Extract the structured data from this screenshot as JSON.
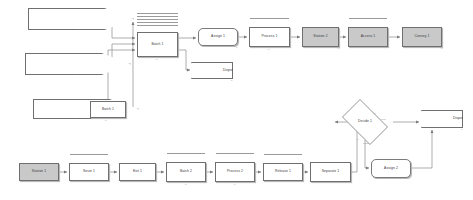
{
  "diagram": {
    "background_color": "#ffffff",
    "line_color": "#8a8a8a",
    "fill_default": "#ffffff",
    "fill_highlight": "#c9c9c9",
    "border_color": "#6f6f6f"
  },
  "nodes": [
    {
      "id": "create1",
      "label": "Create 1",
      "shape": "create",
      "x": 28,
      "y": 8,
      "w": 52,
      "h": 22,
      "fill": "#ffffff"
    },
    {
      "id": "create2",
      "label": "Create 2",
      "shape": "create",
      "x": 25,
      "y": 53,
      "w": 52,
      "h": 22,
      "fill": "#ffffff"
    },
    {
      "id": "create3",
      "label": "Create 3",
      "shape": "create",
      "x": 33,
      "y": 99,
      "w": 45,
      "h": 20,
      "fill": "#ffffff"
    },
    {
      "id": "batch1b",
      "label": "Batch 1",
      "shape": "rect",
      "x": 90,
      "y": 101,
      "w": 36,
      "h": 17,
      "fill": "#ffffff"
    },
    {
      "id": "batch1",
      "label": "Batch 1",
      "shape": "rect",
      "x": 137,
      "y": 32,
      "w": 41,
      "h": 25,
      "fill": "#ffffff"
    },
    {
      "id": "assign1",
      "label": "Assign 1",
      "shape": "assign",
      "x": 198,
      "y": 28,
      "w": 40,
      "h": 18,
      "fill": "#ffffff"
    },
    {
      "id": "dispose1",
      "label": "Dispose 1",
      "shape": "dispose",
      "x": 191,
      "y": 62,
      "w": 42,
      "h": 17,
      "fill": "#ffffff"
    },
    {
      "id": "process1",
      "label": "Process 1",
      "shape": "rect",
      "x": 249,
      "y": 27,
      "w": 41,
      "h": 20,
      "fill": "#ffffff"
    },
    {
      "id": "station2",
      "label": "Station 2",
      "shape": "rect",
      "x": 302,
      "y": 27,
      "w": 37,
      "h": 20,
      "fill": "#c9c9c9"
    },
    {
      "id": "access1",
      "label": "Access 1",
      "shape": "rect",
      "x": 348,
      "y": 27,
      "w": 40,
      "h": 20,
      "fill": "#c9c9c9"
    },
    {
      "id": "convey1",
      "label": "Convey 1",
      "shape": "rect",
      "x": 402,
      "y": 27,
      "w": 40,
      "h": 20,
      "fill": "#c9c9c9"
    },
    {
      "id": "decide1",
      "label": "Decide 1",
      "shape": "decide",
      "x": 337,
      "y": 104,
      "w": 56,
      "h": 36,
      "fill": "#ffffff"
    },
    {
      "id": "dispose2",
      "label": "Dispose 2",
      "shape": "dispose",
      "x": 421,
      "y": 110,
      "w": 42,
      "h": 18,
      "fill": "#ffffff"
    },
    {
      "id": "assign2",
      "label": "Assign 2",
      "shape": "assign",
      "x": 371,
      "y": 159,
      "w": 40,
      "h": 19,
      "fill": "#ffffff"
    },
    {
      "id": "station1",
      "label": "Station 1",
      "shape": "rect",
      "x": 19,
      "y": 163,
      "w": 40,
      "h": 18,
      "fill": "#c9c9c9"
    },
    {
      "id": "seize1",
      "label": "Seize 1",
      "shape": "rect",
      "x": 69,
      "y": 163,
      "w": 40,
      "h": 18,
      "fill": "#ffffff"
    },
    {
      "id": "exit1",
      "label": "Exit 1",
      "shape": "rect",
      "x": 119,
      "y": 163,
      "w": 37,
      "h": 18,
      "fill": "#ffffff"
    },
    {
      "id": "batch2",
      "label": "Batch 2",
      "shape": "rect",
      "x": 166,
      "y": 162,
      "w": 40,
      "h": 20,
      "fill": "#ffffff"
    },
    {
      "id": "process2",
      "label": "Process 2",
      "shape": "rect",
      "x": 215,
      "y": 162,
      "w": 40,
      "h": 20,
      "fill": "#ffffff"
    },
    {
      "id": "release1",
      "label": "Release 1",
      "shape": "rect",
      "x": 263,
      "y": 163,
      "w": 40,
      "h": 18,
      "fill": "#ffffff"
    },
    {
      "id": "separate1",
      "label": "Separate 1",
      "shape": "rect",
      "x": 310,
      "y": 162,
      "w": 41,
      "h": 20,
      "fill": "#ffffff"
    }
  ],
  "queues": [
    {
      "id": "q-batch1",
      "for": "batch1",
      "x": 137,
      "y": 13,
      "w": 41,
      "lines": 5
    },
    {
      "id": "q-access1",
      "for": "access1",
      "x": 349,
      "y": 18,
      "w": 38,
      "lines": 1
    },
    {
      "id": "q-process1",
      "for": "process1",
      "x": 250,
      "y": 18,
      "w": 39,
      "lines": 1
    },
    {
      "id": "q-seize1",
      "for": "seize1",
      "x": 70,
      "y": 154,
      "w": 38,
      "lines": 1
    },
    {
      "id": "q-batch2",
      "for": "batch2",
      "x": 167,
      "y": 153,
      "w": 38,
      "lines": 1
    },
    {
      "id": "q-process2",
      "for": "process2",
      "x": 216,
      "y": 153,
      "w": 38,
      "lines": 1
    },
    {
      "id": "q-release1",
      "for": "release1",
      "x": 264,
      "y": 154,
      "w": 38,
      "lines": 1
    }
  ],
  "branch_labels": [
    {
      "id": "decide-true",
      "text": "0",
      "x": 374,
      "y": 113
    },
    {
      "id": "decide-true2",
      "text": "True",
      "x": 381,
      "y": 119
    },
    {
      "id": "decide-false",
      "text": "0",
      "x": 357,
      "y": 139
    },
    {
      "id": "decide-false2",
      "text": "False",
      "x": 363,
      "y": 143
    }
  ],
  "counters": [
    {
      "id": "c-create1",
      "text": "0",
      "x": 78,
      "y": 29
    },
    {
      "id": "c-create2",
      "text": "0",
      "x": 75,
      "y": 74
    },
    {
      "id": "c-create3",
      "text": "0",
      "x": 76,
      "y": 118
    },
    {
      "id": "c-batch1b",
      "text": "0",
      "x": 105,
      "y": 120
    },
    {
      "id": "c-batch1",
      "text": "0",
      "x": 156,
      "y": 59
    },
    {
      "id": "c-assign1",
      "text": "0",
      "x": 236,
      "y": 47
    },
    {
      "id": "c-dispose1",
      "text": "0",
      "x": 231,
      "y": 80
    },
    {
      "id": "c-process1",
      "text": "0",
      "x": 268,
      "y": 49
    },
    {
      "id": "c-station2",
      "text": "0",
      "x": 338,
      "y": 48
    },
    {
      "id": "c-convey1",
      "text": "0",
      "x": 441,
      "y": 48
    },
    {
      "id": "c-dispose2",
      "text": "0",
      "x": 461,
      "y": 129
    },
    {
      "id": "c-batch2",
      "text": "0",
      "x": 185,
      "y": 184
    },
    {
      "id": "c-process2",
      "text": "0",
      "x": 234,
      "y": 184
    },
    {
      "id": "c-separate1",
      "text": "0",
      "x": 351,
      "y": 172
    }
  ],
  "edges": [
    {
      "id": "e-create1-batch1",
      "from": "create1",
      "to": "batch1",
      "d": "M 80 19 L 112 19 L 112 38 L 135 38"
    },
    {
      "id": "e-create2-batch1",
      "from": "create2",
      "to": "batch1",
      "d": "M 77 64 L 112 64 L 112 44 L 135 44"
    },
    {
      "id": "e-create3-batch1b",
      "from": "create3",
      "to": "batch1b",
      "d": "M 78 109 L 88 109"
    },
    {
      "id": "e-batch1b-up",
      "from": "batch1b",
      "to": "batch1",
      "d": "M 126 109 L 133 109 L 133 22"
    },
    {
      "id": "e-batch1b-feed",
      "from": "batch1b",
      "to": "batch1",
      "d": "M 108 101 L 108 50 L 135 50"
    },
    {
      "id": "e-batch1-assign1",
      "from": "batch1",
      "to": "assign1",
      "d": "M 178 38 L 196 38"
    },
    {
      "id": "e-batch1-dispose1",
      "from": "batch1",
      "to": "dispose1",
      "d": "M 178 50 L 186 50 L 186 70 L 190 70"
    },
    {
      "id": "e-assign1-process1",
      "from": "assign1",
      "to": "process1",
      "d": "M 238 37 L 247 37"
    },
    {
      "id": "e-process1-station2",
      "from": "process1",
      "to": "station2",
      "d": "M 290 37 L 300 37"
    },
    {
      "id": "e-station2-access1",
      "from": "station2",
      "to": "access1",
      "d": "M 339 37 L 346 37"
    },
    {
      "id": "e-access1-convey1",
      "from": "access1",
      "to": "convey1",
      "d": "M 388 37 L 400 37"
    },
    {
      "id": "e-station1-seize1",
      "from": "station1",
      "to": "seize1",
      "d": "M 59 172 L 67 172"
    },
    {
      "id": "e-seize1-exit1",
      "from": "seize1",
      "to": "exit1",
      "d": "M 109 172 L 117 172"
    },
    {
      "id": "e-exit1-batch2",
      "from": "exit1",
      "to": "batch2",
      "d": "M 156 172 L 164 172"
    },
    {
      "id": "e-batch2-process2",
      "from": "batch2",
      "to": "process2",
      "d": "M 206 172 L 213 172"
    },
    {
      "id": "e-process2-release1",
      "from": "process2",
      "to": "release1",
      "d": "M 255 172 L 261 172"
    },
    {
      "id": "e-release1-separate",
      "from": "release1",
      "to": "separate1",
      "d": "M 303 172 L 308 172"
    },
    {
      "id": "e-separate-decide",
      "from": "separate1",
      "to": "decide1",
      "d": "M 351 172 L 357 172 L 357 122 L 335 122"
    },
    {
      "id": "e-decide-true",
      "from": "decide1",
      "to": "dispose2",
      "d": "M 393 122 L 419 122"
    },
    {
      "id": "e-decide-false",
      "from": "decide1",
      "to": "assign2",
      "d": "M 365 140 L 365 168 L 369 168"
    },
    {
      "id": "e-assign2-dispose2",
      "from": "assign2",
      "to": "dispose2",
      "d": "M 411 168 L 432 168 L 432 130"
    }
  ]
}
